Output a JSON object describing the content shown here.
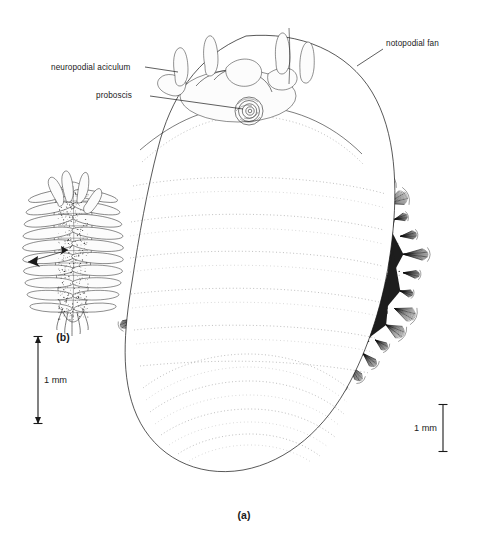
{
  "figure": {
    "kind": "scientific-illustration",
    "background_color": "#ffffff",
    "ink_color": "#1a1a1a"
  },
  "labels": {
    "neuropodial_aciculum": "neuropodial  aciculum",
    "proboscis": "proboscis",
    "notopodial_fan": "notopodial fan"
  },
  "panels": {
    "a": "(a)",
    "b": "(b)"
  },
  "scale_bars": {
    "left": {
      "text": "1 mm",
      "orientation": "vertical",
      "has_arrowheads": true
    },
    "right": {
      "text": "1 mm",
      "orientation": "vertical",
      "has_arrowheads": false
    }
  }
}
